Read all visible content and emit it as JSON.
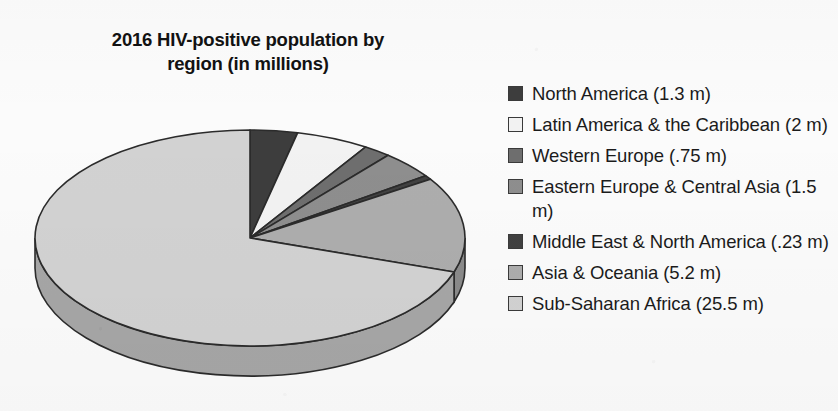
{
  "chart_data": {
    "type": "pie",
    "title": "2016 HIV-positive population by\nregion (in millions)",
    "unit": "millions",
    "three_d": true,
    "start_angle_deg": 0,
    "direction": "clockwise",
    "legend_position": "right",
    "total": 36.48,
    "categories": [
      "North America (1.3 m)",
      "Latin America & the Caribbean (2 m)",
      "Western Europe (.75 m)",
      "Eastern Europe & Central Asia (1.5 m)",
      "Middle East & North America (.23 m)",
      "Asia & Oceania (5.2 m)",
      "Sub-Saharan Africa (25.5 m)"
    ],
    "values": [
      1.3,
      2,
      0.75,
      1.5,
      0.23,
      5.2,
      25.5
    ],
    "colors": [
      "#3d3d3d",
      "#f2f2f2",
      "#6e6e6e",
      "#8e8e8e",
      "#414141",
      "#adadad",
      "#d2d2d2"
    ],
    "side_colors": [
      "#2f2f2f",
      "#c2c2c2",
      "#575757",
      "#727272",
      "#333333",
      "#8a8a8a",
      "#a6a6a6"
    ],
    "stroke": "#2b2b2b"
  },
  "legend": {
    "items": [
      {
        "label": "North America (1.3 m)",
        "value": 1.3,
        "color": "#3d3d3d"
      },
      {
        "label": "Latin America & the Caribbean (2 m)",
        "value": 2,
        "color": "#f2f2f2"
      },
      {
        "label": "Western Europe (.75 m)",
        "value": 0.75,
        "color": "#6e6e6e"
      },
      {
        "label": "Eastern Europe & Central Asia (1.5 m)",
        "value": 1.5,
        "color": "#8e8e8e"
      },
      {
        "label": "Middle East & North America (.23 m)",
        "value": 0.23,
        "color": "#414141"
      },
      {
        "label": "Asia & Oceania (5.2 m)",
        "value": 5.2,
        "color": "#adadad"
      },
      {
        "label": "Sub-Saharan Africa (25.5 m)",
        "value": 25.5,
        "color": "#d2d2d2"
      }
    ]
  }
}
